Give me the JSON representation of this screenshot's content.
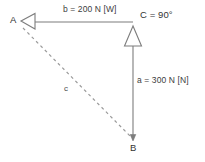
{
  "diagram": {
    "type": "vector-triangle-diagram",
    "background_color": "#ffffff",
    "line_color": "#808080",
    "text_color": "#3a3a3a",
    "vertices": [
      {
        "id": "A",
        "label": "A",
        "x": 16,
        "y": 20
      },
      {
        "id": "B",
        "label": "B",
        "x": 133,
        "y": 140
      },
      {
        "id": "C",
        "label": "C",
        "x": 133,
        "y": 22
      }
    ],
    "vertex_annotations": [
      {
        "id": "C",
        "label": "C = 90°"
      }
    ],
    "sides": [
      {
        "id": "b",
        "label": "b = 200 N [W]",
        "magnitude": 200,
        "unit": "N",
        "direction": "W",
        "from": "C",
        "to": "A",
        "style": "solid",
        "arrowhead": "open-triangle-left"
      },
      {
        "id": "a",
        "label": "a = 300 N [N]",
        "magnitude": 300,
        "unit": "N",
        "direction": "N",
        "from": "B",
        "to": "C",
        "style": "solid",
        "arrowhead": "open-triangle-up"
      },
      {
        "id": "c",
        "label": "c",
        "from": "A",
        "to": "B",
        "style": "dashed",
        "arrowhead": "none"
      }
    ]
  }
}
